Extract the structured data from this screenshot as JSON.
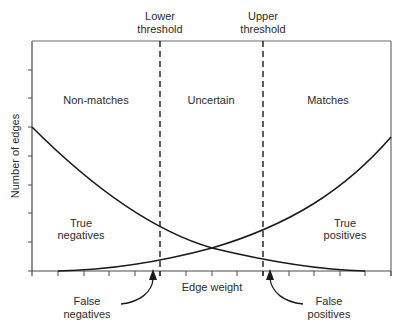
{
  "diagram": {
    "y_axis_label": "Number of edges",
    "x_axis_label": "Edge weight",
    "thresholds": {
      "lower": {
        "line1": "Lower",
        "line2": "threshold"
      },
      "upper": {
        "line1": "Upper",
        "line2": "threshold"
      }
    },
    "regions": {
      "left": "Non-matches",
      "middle": "Uncertain",
      "right": "Matches"
    },
    "areas": {
      "true_negatives": {
        "line1": "True",
        "line2": "negatives"
      },
      "true_positives": {
        "line1": "True",
        "line2": "positives"
      }
    },
    "callouts": {
      "false_negatives": {
        "line1": "False",
        "line2": "negatives"
      },
      "false_positives": {
        "line1": "False",
        "line2": "positives"
      }
    },
    "curves": [
      {
        "name": "non-match distribution",
        "shape": "decreasing",
        "description": "starts high at left axis, decays toward zero at right"
      },
      {
        "name": "match distribution",
        "shape": "increasing",
        "description": "starts near zero at left, grows toward right edge"
      }
    ],
    "colors": {
      "line": "#1a1a1a",
      "axis": "#4a4a4a",
      "text": "#2b2b2b",
      "background": "#ffffff"
    }
  }
}
